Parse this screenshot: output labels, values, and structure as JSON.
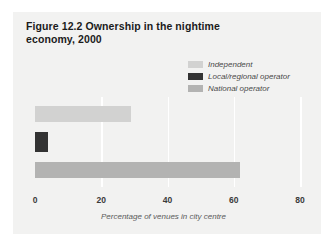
{
  "figure": {
    "title": "Figure 12.2  Ownership in the nightime economy, 2000",
    "panel_color": "#f2f2f1",
    "background_color": "#ffffff"
  },
  "legend": {
    "items": [
      {
        "label": "Independent",
        "color": "#d2d2d1"
      },
      {
        "label": "Local/regional operator",
        "color": "#333333"
      },
      {
        "label": "National operator",
        "color": "#b3b3b2"
      }
    ]
  },
  "axis": {
    "ticks": [
      {
        "label": "0",
        "value": 0
      },
      {
        "label": "20",
        "value": 20
      },
      {
        "label": "40",
        "value": 40
      },
      {
        "label": "60",
        "value": 60
      },
      {
        "label": "80",
        "value": 80
      }
    ],
    "xlabel": "Percentage of venues in city centre"
  },
  "chart_data": {
    "type": "bar",
    "orientation": "horizontal",
    "title": "Figure 12.2  Ownership in the nightime economy, 2000",
    "xlabel": "Percentage of venues in city centre",
    "ylabel": "",
    "categories": [
      "Independent",
      "Local/regional operator",
      "National operator"
    ],
    "values": [
      29,
      4,
      62
    ],
    "colors": [
      "#d2d2d1",
      "#333333",
      "#b3b3b2"
    ],
    "xlim": [
      0,
      80
    ],
    "xticks": [
      0,
      20,
      40,
      60,
      80
    ],
    "grid": true,
    "gridline_color": "#ffffff",
    "legend_position": "upper right"
  }
}
